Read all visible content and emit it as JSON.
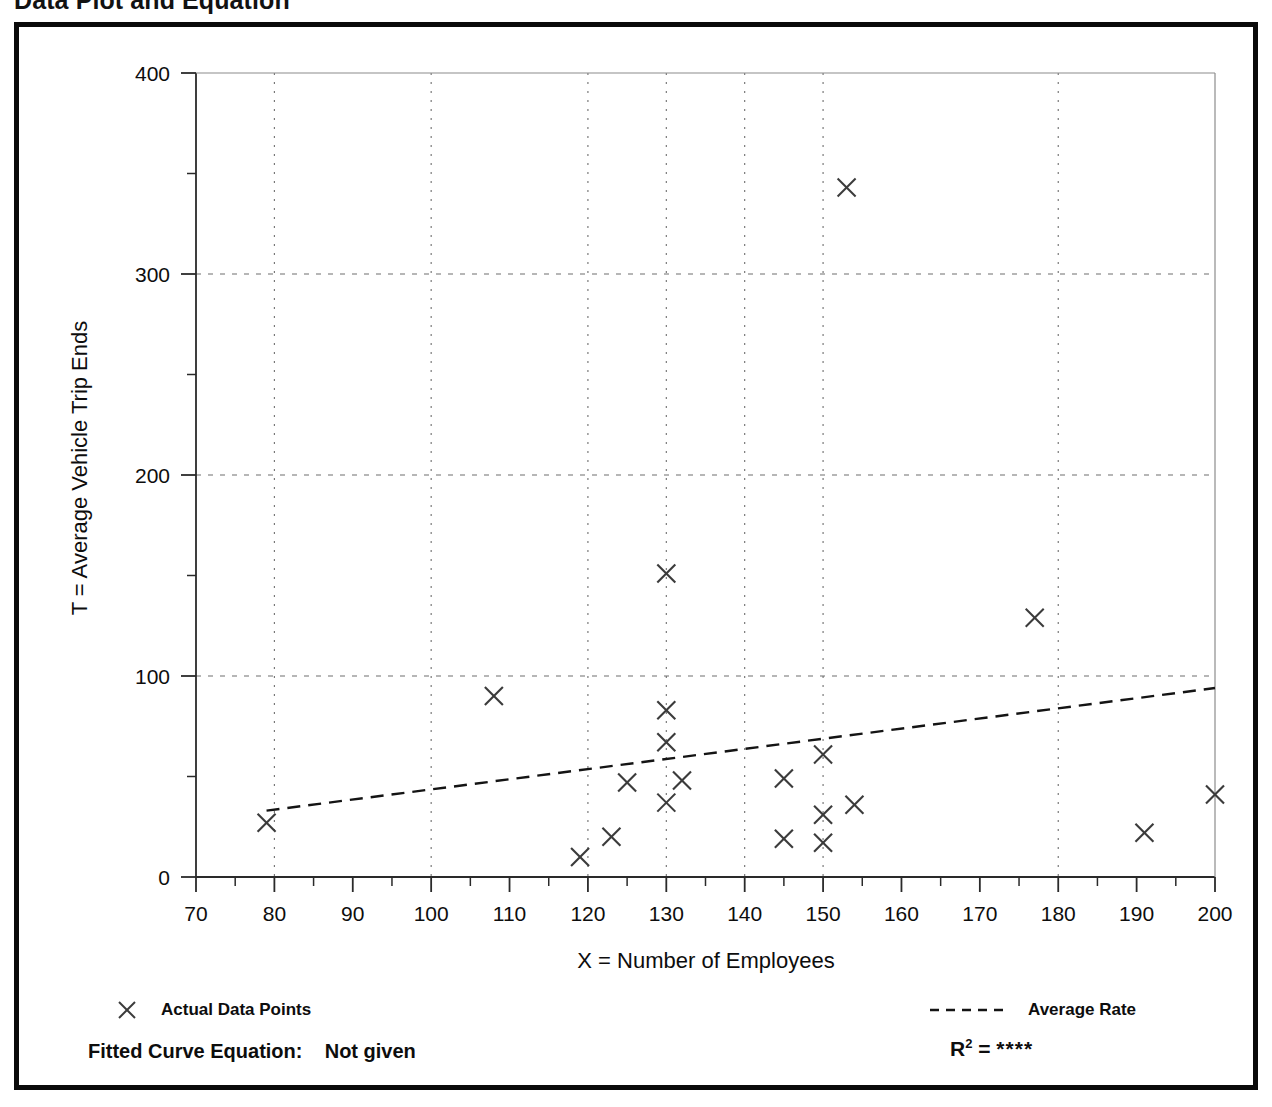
{
  "page": {
    "title": "Data Plot and Equation"
  },
  "legend": {
    "points_label": "Actual Data Points",
    "points_marker": "x-marker-icon",
    "line_label": "Average Rate",
    "line_marker": "dashed-line-icon"
  },
  "footer": {
    "equation_label": "Fitted Curve Equation:",
    "equation_value": "Not given",
    "r2_label": "R",
    "r2_exponent": "2",
    "r2_equals": "=",
    "r2_value": "****"
  },
  "chart_data": {
    "type": "scatter",
    "title": "Data Plot and Equation",
    "xlabel": "X = Number of Employees",
    "ylabel": "T = Average Vehicle Trip Ends",
    "xlim": [
      70,
      200
    ],
    "ylim": [
      0,
      400
    ],
    "xticks": [
      70,
      80,
      90,
      100,
      110,
      120,
      130,
      140,
      150,
      160,
      170,
      180,
      190,
      200
    ],
    "xtick_labels": [
      "70",
      "80",
      "90",
      "100",
      "110",
      "120",
      "130",
      "140",
      "150",
      "160",
      "170",
      "180",
      "190",
      "200"
    ],
    "x_minor_step": 5,
    "yticks": [
      0,
      100,
      200,
      300,
      400
    ],
    "ytick_labels": [
      "0",
      "100",
      "200",
      "300",
      "400"
    ],
    "y_minor_step": 50,
    "grid": {
      "x_gridlines": [
        80,
        100,
        120,
        130,
        140,
        150,
        180
      ],
      "y_gridlines": [
        100,
        200,
        300
      ],
      "style": "dotted"
    },
    "legend_position": "below-axes",
    "series": [
      {
        "name": "Actual Data Points",
        "marker": "x",
        "points": [
          [
            79,
            27
          ],
          [
            108,
            90
          ],
          [
            119,
            10
          ],
          [
            123,
            20
          ],
          [
            125,
            47
          ],
          [
            130,
            151
          ],
          [
            130,
            83
          ],
          [
            130,
            67
          ],
          [
            130,
            37
          ],
          [
            132,
            48
          ],
          [
            145,
            49
          ],
          [
            145,
            19
          ],
          [
            150,
            61
          ],
          [
            150,
            31
          ],
          [
            150,
            17
          ],
          [
            153,
            343
          ],
          [
            154,
            36
          ],
          [
            177,
            129
          ],
          [
            191,
            22
          ],
          [
            200,
            41
          ]
        ]
      },
      {
        "name": "Average Rate",
        "type": "line",
        "style": "dashed",
        "endpoints": [
          [
            79,
            33
          ],
          [
            200,
            94
          ]
        ]
      }
    ]
  }
}
